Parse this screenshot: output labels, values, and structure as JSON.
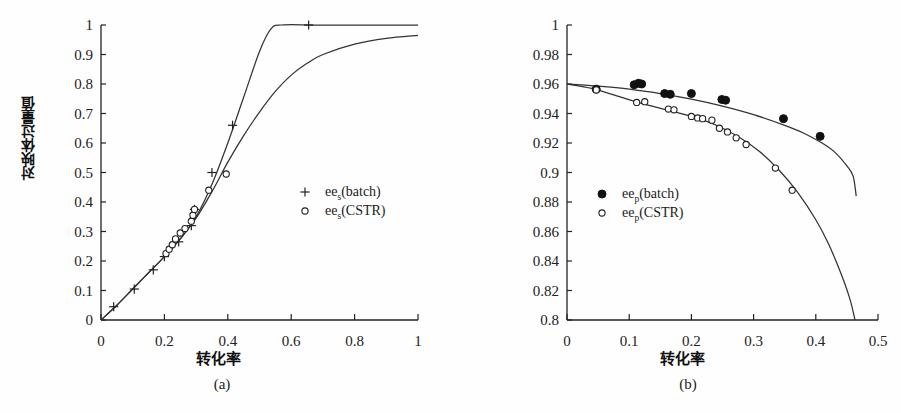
{
  "figure": {
    "panels": [
      {
        "id": "a",
        "caption": "(a)",
        "xlabel": "转化率",
        "ylabel": "对映体过量值",
        "legend": [
          {
            "marker": "plus",
            "base": "ee",
            "sub": "s",
            "suffix": "(batch)"
          },
          {
            "marker": "open-circle",
            "base": "ee",
            "sub": "s",
            "suffix": "(CSTR)"
          }
        ]
      },
      {
        "id": "b",
        "caption": "(b)",
        "xlabel": "转化率",
        "ylabel": "对映体过量值",
        "legend": [
          {
            "marker": "filled-circle",
            "base": "ee",
            "sub": "p",
            "suffix": "(batch)"
          },
          {
            "marker": "open-circle",
            "base": "ee",
            "sub": "p",
            "suffix": "(CSTR)"
          }
        ]
      }
    ]
  },
  "chart_data": [
    {
      "type": "scatter",
      "panel": "a",
      "title": "",
      "xlabel": "转化率",
      "ylabel": "对映体过量值",
      "xlim": [
        0,
        1
      ],
      "ylim": [
        0,
        1
      ],
      "xticks": [
        0,
        0.2,
        0.4,
        0.6,
        0.8,
        1
      ],
      "xtick_labels": [
        "0",
        "0.2",
        "0.4",
        "0.6",
        "0.8",
        "1"
      ],
      "yticks": [
        0,
        0.1,
        0.2,
        0.3,
        0.4,
        0.5,
        0.6,
        0.7,
        0.8,
        0.9,
        1
      ],
      "ytick_labels": [
        "0",
        "0.1",
        "0.2",
        "0.3",
        "0.4",
        "0.5",
        "0.6",
        "0.7",
        "0.8",
        "0.9",
        "1"
      ],
      "grid": false,
      "legend_position": "center-right",
      "series": [
        {
          "name": "ee_s(batch)",
          "marker": "plus",
          "points": [
            {
              "x": 0.04,
              "y": 0.045
            },
            {
              "x": 0.105,
              "y": 0.105
            },
            {
              "x": 0.165,
              "y": 0.17
            },
            {
              "x": 0.2,
              "y": 0.215
            },
            {
              "x": 0.245,
              "y": 0.265
            },
            {
              "x": 0.285,
              "y": 0.32
            },
            {
              "x": 0.295,
              "y": 0.375
            },
            {
              "x": 0.35,
              "y": 0.5
            },
            {
              "x": 0.415,
              "y": 0.66
            },
            {
              "x": 0.655,
              "y": 1.0
            }
          ]
        },
        {
          "name": "ee_s(CSTR)",
          "marker": "open-circle",
          "points": [
            {
              "x": 0.205,
              "y": 0.225
            },
            {
              "x": 0.215,
              "y": 0.24
            },
            {
              "x": 0.225,
              "y": 0.255
            },
            {
              "x": 0.235,
              "y": 0.275
            },
            {
              "x": 0.25,
              "y": 0.295
            },
            {
              "x": 0.265,
              "y": 0.31
            },
            {
              "x": 0.285,
              "y": 0.335
            },
            {
              "x": 0.29,
              "y": 0.355
            },
            {
              "x": 0.295,
              "y": 0.375
            },
            {
              "x": 0.34,
              "y": 0.44
            },
            {
              "x": 0.395,
              "y": 0.495
            }
          ]
        }
      ],
      "curves": [
        {
          "name": "batch-model",
          "description": "rises steeply, saturates at ee = 1.0 near x = 0.57",
          "points": [
            {
              "x": 0.0,
              "y": 0.0
            },
            {
              "x": 0.05,
              "y": 0.05
            },
            {
              "x": 0.1,
              "y": 0.105
            },
            {
              "x": 0.15,
              "y": 0.16
            },
            {
              "x": 0.2,
              "y": 0.215
            },
            {
              "x": 0.25,
              "y": 0.275
            },
            {
              "x": 0.3,
              "y": 0.35
            },
            {
              "x": 0.35,
              "y": 0.46
            },
            {
              "x": 0.4,
              "y": 0.6
            },
            {
              "x": 0.45,
              "y": 0.755
            },
            {
              "x": 0.5,
              "y": 0.91
            },
            {
              "x": 0.535,
              "y": 0.985
            },
            {
              "x": 0.57,
              "y": 1.0
            },
            {
              "x": 0.7,
              "y": 1.0
            },
            {
              "x": 1.0,
              "y": 1.0
            }
          ]
        },
        {
          "name": "cstr-model",
          "description": "rises and asymptotes to ee ≈ 0.965 at x = 1",
          "points": [
            {
              "x": 0.0,
              "y": 0.0
            },
            {
              "x": 0.05,
              "y": 0.05
            },
            {
              "x": 0.1,
              "y": 0.105
            },
            {
              "x": 0.15,
              "y": 0.16
            },
            {
              "x": 0.2,
              "y": 0.215
            },
            {
              "x": 0.25,
              "y": 0.275
            },
            {
              "x": 0.3,
              "y": 0.345
            },
            {
              "x": 0.35,
              "y": 0.435
            },
            {
              "x": 0.4,
              "y": 0.535
            },
            {
              "x": 0.45,
              "y": 0.625
            },
            {
              "x": 0.5,
              "y": 0.705
            },
            {
              "x": 0.55,
              "y": 0.775
            },
            {
              "x": 0.6,
              "y": 0.83
            },
            {
              "x": 0.65,
              "y": 0.87
            },
            {
              "x": 0.7,
              "y": 0.9
            },
            {
              "x": 0.8,
              "y": 0.935
            },
            {
              "x": 0.9,
              "y": 0.955
            },
            {
              "x": 1.0,
              "y": 0.965
            }
          ]
        }
      ]
    },
    {
      "type": "scatter",
      "panel": "b",
      "title": "",
      "xlabel": "转化率",
      "ylabel": "对映体过量值",
      "xlim": [
        0,
        0.5
      ],
      "ylim": [
        0.8,
        1
      ],
      "xticks": [
        0,
        0.1,
        0.2,
        0.3,
        0.4,
        0.5
      ],
      "xtick_labels": [
        "0",
        "0.1",
        "0.2",
        "0.3",
        "0.4",
        "0.5"
      ],
      "yticks": [
        0.8,
        0.82,
        0.84,
        0.86,
        0.88,
        0.9,
        0.92,
        0.94,
        0.96,
        0.98,
        1
      ],
      "ytick_labels": [
        "0.8",
        "0.82",
        "0.84",
        "0.86",
        "0.88",
        "0.9",
        "0.92",
        "0.94",
        "0.96",
        "0.98",
        "1"
      ],
      "grid": false,
      "legend_position": "center-left",
      "series": [
        {
          "name": "ee_p(batch)",
          "marker": "filled-circle",
          "points": [
            {
              "x": 0.047,
              "y": 0.9565
            },
            {
              "x": 0.108,
              "y": 0.9595
            },
            {
              "x": 0.115,
              "y": 0.9605
            },
            {
              "x": 0.12,
              "y": 0.96
            },
            {
              "x": 0.157,
              "y": 0.9535
            },
            {
              "x": 0.166,
              "y": 0.953
            },
            {
              "x": 0.2,
              "y": 0.9535
            },
            {
              "x": 0.249,
              "y": 0.9495
            },
            {
              "x": 0.255,
              "y": 0.949
            },
            {
              "x": 0.348,
              "y": 0.9365
            },
            {
              "x": 0.407,
              "y": 0.9245
            }
          ]
        },
        {
          "name": "ee_p(CSTR)",
          "marker": "open-circle",
          "points": [
            {
              "x": 0.047,
              "y": 0.956
            },
            {
              "x": 0.112,
              "y": 0.9475
            },
            {
              "x": 0.125,
              "y": 0.948
            },
            {
              "x": 0.163,
              "y": 0.943
            },
            {
              "x": 0.172,
              "y": 0.9425
            },
            {
              "x": 0.2,
              "y": 0.938
            },
            {
              "x": 0.21,
              "y": 0.937
            },
            {
              "x": 0.218,
              "y": 0.9365
            },
            {
              "x": 0.233,
              "y": 0.9355
            },
            {
              "x": 0.245,
              "y": 0.93
            },
            {
              "x": 0.258,
              "y": 0.9275
            },
            {
              "x": 0.272,
              "y": 0.9235
            },
            {
              "x": 0.288,
              "y": 0.919
            },
            {
              "x": 0.335,
              "y": 0.903
            },
            {
              "x": 0.362,
              "y": 0.888
            }
          ]
        }
      ],
      "curves": [
        {
          "name": "batch-model",
          "description": "starts 0.96 at x=0, decreases to ~0.884 at x=0.46",
          "points": [
            {
              "x": 0.0,
              "y": 0.96
            },
            {
              "x": 0.05,
              "y": 0.9585
            },
            {
              "x": 0.1,
              "y": 0.9565
            },
            {
              "x": 0.15,
              "y": 0.9535
            },
            {
              "x": 0.2,
              "y": 0.9497
            },
            {
              "x": 0.25,
              "y": 0.945
            },
            {
              "x": 0.3,
              "y": 0.9392
            },
            {
              "x": 0.35,
              "y": 0.932
            },
            {
              "x": 0.38,
              "y": 0.9268
            },
            {
              "x": 0.41,
              "y": 0.92
            },
            {
              "x": 0.43,
              "y": 0.914
            },
            {
              "x": 0.45,
              "y": 0.9045
            },
            {
              "x": 0.46,
              "y": 0.8975
            },
            {
              "x": 0.465,
              "y": 0.884
            }
          ]
        },
        {
          "name": "cstr-model",
          "description": "starts 0.96 at x=0, falls steeply, crosses 0.8 near x=0.46",
          "points": [
            {
              "x": 0.0,
              "y": 0.96
            },
            {
              "x": 0.04,
              "y": 0.957
            },
            {
              "x": 0.08,
              "y": 0.952
            },
            {
              "x": 0.12,
              "y": 0.9468
            },
            {
              "x": 0.16,
              "y": 0.9425
            },
            {
              "x": 0.2,
              "y": 0.938
            },
            {
              "x": 0.24,
              "y": 0.932
            },
            {
              "x": 0.28,
              "y": 0.923
            },
            {
              "x": 0.31,
              "y": 0.914
            },
            {
              "x": 0.34,
              "y": 0.902
            },
            {
              "x": 0.37,
              "y": 0.887
            },
            {
              "x": 0.4,
              "y": 0.868
            },
            {
              "x": 0.42,
              "y": 0.852
            },
            {
              "x": 0.44,
              "y": 0.832
            },
            {
              "x": 0.455,
              "y": 0.814
            },
            {
              "x": 0.463,
              "y": 0.8
            }
          ]
        }
      ]
    }
  ],
  "colors": {
    "axis": "#222222",
    "curve": "#333333",
    "marker_fill": "#111111",
    "background": "#ffffff"
  }
}
